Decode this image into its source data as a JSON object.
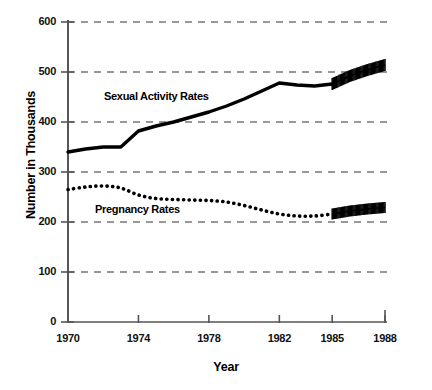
{
  "chart_data": {
    "type": "line",
    "title": "",
    "xlabel": "Year",
    "ylabel": "Number in Thousands",
    "xlim": [
      1970,
      1988
    ],
    "ylim": [
      0,
      600
    ],
    "grid": true,
    "legend_position": "inline-annotations",
    "x_ticks": [
      "1970",
      "1974",
      "1978",
      "1982",
      "1985",
      "1988"
    ],
    "x_tick_values": [
      1970,
      1974,
      1978,
      1982,
      1985,
      1988
    ],
    "y_ticks": [
      "0",
      "100",
      "200",
      "300",
      "400",
      "500",
      "600"
    ],
    "y_tick_values": [
      0,
      100,
      200,
      300,
      400,
      500,
      600
    ],
    "series": [
      {
        "name": "Sexual Activity Rates",
        "style": "solid-thick",
        "x": [
          1970,
          1971,
          1972,
          1973,
          1974,
          1975,
          1976,
          1977,
          1978,
          1979,
          1980,
          1981,
          1982,
          1983,
          1984,
          1985
        ],
        "values": [
          340,
          346,
          350,
          350,
          382,
          392,
          400,
          410,
          420,
          432,
          446,
          462,
          478,
          474,
          472,
          476
        ],
        "projection": {
          "style": "hatched-band",
          "x": [
            1985,
            1986,
            1987,
            1988
          ],
          "values": [
            476,
            492,
            504,
            514
          ]
        }
      },
      {
        "name": "Pregnancy Rates",
        "style": "dotted",
        "x": [
          1970,
          1971,
          1972,
          1973,
          1974,
          1975,
          1976,
          1977,
          1978,
          1979,
          1980,
          1981,
          1982,
          1983,
          1984,
          1985
        ],
        "values": [
          265,
          270,
          272,
          268,
          254,
          247,
          245,
          244,
          243,
          240,
          233,
          224,
          216,
          212,
          212,
          216
        ],
        "projection": {
          "style": "hatched-band",
          "x": [
            1985,
            1986,
            1987,
            1988
          ],
          "values": [
            216,
            222,
            226,
            229
          ]
        }
      }
    ]
  },
  "annotations": {
    "sexual_activity_label": "Sexual Activity Rates",
    "pregnancy_label": "Pregnancy Rates"
  },
  "colors": {
    "ink": "#000000",
    "axis": "#555555",
    "grid": "#333333",
    "background": "#ffffff"
  }
}
